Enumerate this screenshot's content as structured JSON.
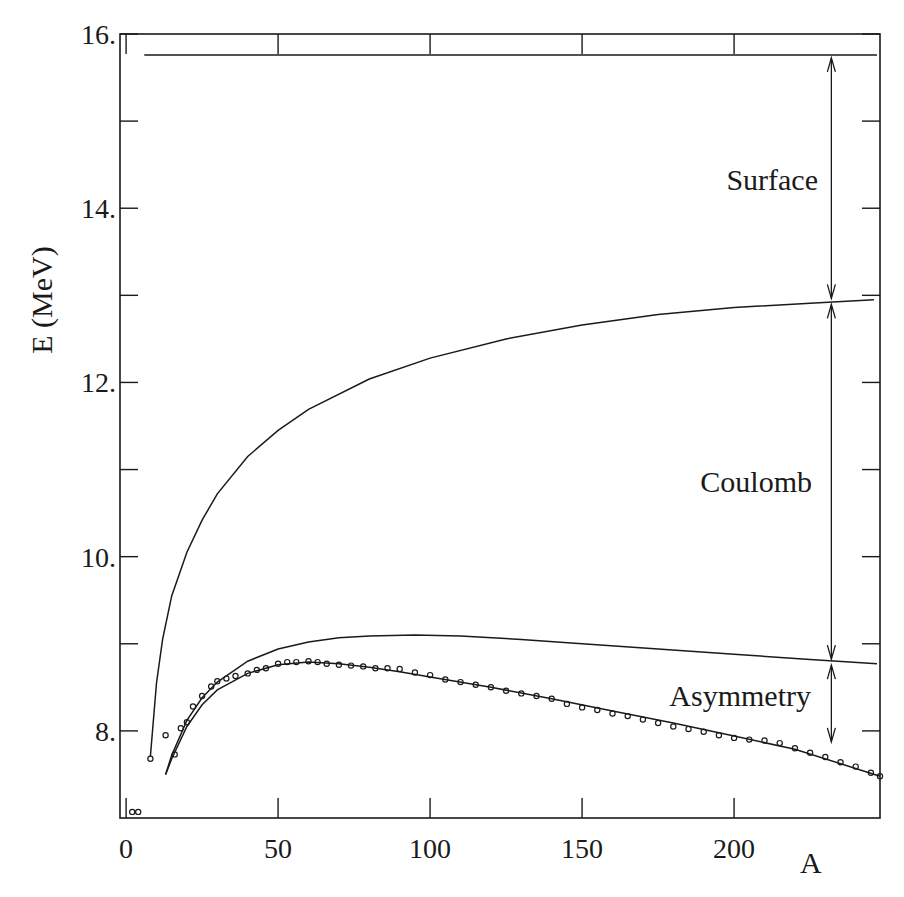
{
  "chart_data": {
    "type": "line",
    "title": "",
    "xlabel": "A",
    "ylabel": "E (MeV)",
    "xlim": [
      -2,
      248
    ],
    "ylim": [
      7.0,
      16.0
    ],
    "grid": false,
    "legend": null,
    "x_ticks": [
      {
        "value": 0,
        "label": "0"
      },
      {
        "value": 50,
        "label": "50"
      },
      {
        "value": 100,
        "label": "100"
      },
      {
        "value": 150,
        "label": "150"
      },
      {
        "value": 200,
        "label": "200"
      }
    ],
    "y_ticks": [
      {
        "value": 16,
        "label": "16."
      },
      {
        "value": 15,
        "label": ""
      },
      {
        "value": 14,
        "label": "14."
      },
      {
        "value": 13,
        "label": ""
      },
      {
        "value": 12,
        "label": "12."
      },
      {
        "value": 11,
        "label": ""
      },
      {
        "value": 10,
        "label": "10."
      },
      {
        "value": 9,
        "label": ""
      },
      {
        "value": 8,
        "label": "8."
      }
    ],
    "series": [
      {
        "name": "Volume",
        "style": "line",
        "x": [
          6,
          247
        ],
        "y": [
          15.76,
          15.76
        ]
      },
      {
        "name": "Volume - Surface",
        "style": "line",
        "x": [
          8,
          10,
          12,
          15,
          20,
          25,
          30,
          40,
          50,
          60,
          80,
          100,
          125,
          150,
          175,
          200,
          225,
          246
        ],
        "y": [
          7.71,
          8.55,
          9.05,
          9.55,
          10.05,
          10.42,
          10.72,
          11.15,
          11.45,
          11.69,
          12.04,
          12.28,
          12.5,
          12.66,
          12.78,
          12.86,
          12.91,
          12.95
        ]
      },
      {
        "name": "Volume - Surface - Coulomb",
        "style": "line",
        "x": [
          13,
          15,
          20,
          25,
          30,
          40,
          50,
          60,
          70,
          80,
          95,
          110,
          130,
          150,
          175,
          200,
          225,
          247
        ],
        "y": [
          7.5,
          7.72,
          8.12,
          8.38,
          8.56,
          8.8,
          8.94,
          9.02,
          9.07,
          9.09,
          9.1,
          9.09,
          9.05,
          9.0,
          8.94,
          8.88,
          8.82,
          8.77
        ]
      },
      {
        "name": "Full fit (+ Asymmetry)",
        "style": "line",
        "x": [
          13,
          15,
          20,
          25,
          30,
          40,
          50,
          60,
          70,
          80,
          90,
          100,
          120,
          140,
          160,
          180,
          200,
          220,
          248
        ],
        "y": [
          7.5,
          7.68,
          8.05,
          8.3,
          8.47,
          8.66,
          8.76,
          8.79,
          8.77,
          8.73,
          8.68,
          8.62,
          8.5,
          8.37,
          8.23,
          8.09,
          7.94,
          7.79,
          7.48
        ]
      },
      {
        "name": "Experimental data",
        "style": "scatter-open-circle",
        "x": [
          2,
          4,
          8,
          13,
          16,
          18,
          20,
          22,
          25,
          28,
          30,
          33,
          36,
          40,
          43,
          46,
          50,
          53,
          56,
          60,
          63,
          66,
          70,
          74,
          78,
          82,
          86,
          90,
          95,
          100,
          105,
          110,
          115,
          120,
          125,
          130,
          135,
          140,
          145,
          150,
          155,
          160,
          165,
          170,
          175,
          180,
          185,
          190,
          195,
          200,
          205,
          210,
          215,
          220,
          225,
          230,
          235,
          240,
          245,
          248
        ],
        "y": [
          7.07,
          7.07,
          7.68,
          7.95,
          7.73,
          8.03,
          8.1,
          8.28,
          8.4,
          8.51,
          8.57,
          8.6,
          8.63,
          8.66,
          8.7,
          8.72,
          8.77,
          8.79,
          8.79,
          8.8,
          8.79,
          8.77,
          8.76,
          8.75,
          8.74,
          8.72,
          8.72,
          8.71,
          8.67,
          8.64,
          8.59,
          8.56,
          8.53,
          8.5,
          8.46,
          8.43,
          8.4,
          8.37,
          8.31,
          8.27,
          8.24,
          8.2,
          8.17,
          8.13,
          8.09,
          8.05,
          8.02,
          7.99,
          7.95,
          7.92,
          7.9,
          7.89,
          7.86,
          7.8,
          7.75,
          7.7,
          7.64,
          7.59,
          7.52,
          7.48
        ]
      }
    ],
    "annotations": [
      {
        "text": "Surface",
        "x_arrow": 232,
        "y_from": 15.76,
        "y_to": 12.93,
        "label_y": 14.3
      },
      {
        "text": "Coulomb",
        "x_arrow": 232,
        "y_from": 12.93,
        "y_to": 8.79,
        "label_y": 10.95
      },
      {
        "text": "Asymmetry",
        "x_arrow": 232,
        "y_from": 8.79,
        "y_to": 7.84,
        "label_y": 8.4
      }
    ]
  },
  "axes": {
    "x_title": "A",
    "y_title": "E (MeV)"
  },
  "labels": {
    "surface": "Surface",
    "coulomb": "Coulomb",
    "asymmetry": "Asymmetry"
  },
  "colors": {
    "ink": "#1a1a1a",
    "background": "#ffffff"
  }
}
